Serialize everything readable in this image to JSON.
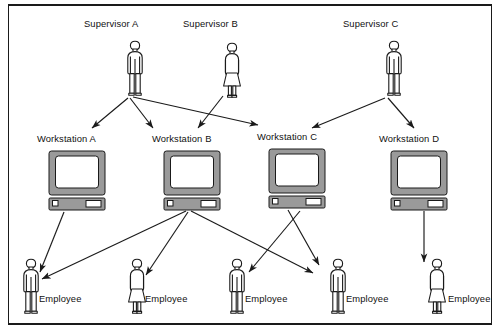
{
  "diagram": {
    "type": "hierarchy-flow",
    "title": "",
    "background_color": "#ffffff",
    "line_color": "#1a1a1a",
    "monitor_fill": "#9a9a9a",
    "screen_fill": "#ffffff",
    "person_fill": "#ffffff",
    "frame": {
      "top_rule": true,
      "bottom_rule": true,
      "left_rule": true,
      "right_rule": true
    }
  },
  "supervisors": [
    {
      "id": "sup-a",
      "label": "Supervisor A",
      "gender": "male",
      "x": 122,
      "y": 40,
      "label_x": 84,
      "label_y": 18
    },
    {
      "id": "sup-b",
      "label": "Supervisor B",
      "gender": "female",
      "x": 219,
      "y": 42,
      "label_x": 183,
      "label_y": 18
    },
    {
      "id": "sup-c",
      "label": "Supervisor C",
      "gender": "male",
      "x": 381,
      "y": 40,
      "label_x": 343,
      "label_y": 18
    }
  ],
  "workstations": [
    {
      "id": "ws-a",
      "label": "Workstation A",
      "x": 48,
      "y": 150,
      "label_x": 37,
      "label_y": 133
    },
    {
      "id": "ws-b",
      "label": "Workstation B",
      "x": 163,
      "y": 150,
      "label_x": 152,
      "label_y": 133
    },
    {
      "id": "ws-c",
      "label": "Workstation C",
      "x": 268,
      "y": 148,
      "label_x": 257,
      "label_y": 131
    },
    {
      "id": "ws-d",
      "label": "Workstation D",
      "x": 390,
      "y": 150,
      "label_x": 379,
      "label_y": 133
    }
  ],
  "employees": [
    {
      "id": "emp-1",
      "label": "Employee",
      "gender": "male",
      "x": 18,
      "y": 258,
      "label_x": 39,
      "label_y": 293
    },
    {
      "id": "emp-2",
      "label": "Employee",
      "gender": "female",
      "x": 124,
      "y": 258,
      "label_x": 145,
      "label_y": 293
    },
    {
      "id": "emp-3",
      "label": "Employee",
      "gender": "male",
      "x": 224,
      "y": 258,
      "label_x": 245,
      "label_y": 293
    },
    {
      "id": "emp-4",
      "label": "Employee",
      "gender": "male",
      "x": 325,
      "y": 258,
      "label_x": 346,
      "label_y": 293
    },
    {
      "id": "emp-5",
      "label": "Employee",
      "gender": "female",
      "x": 424,
      "y": 258,
      "label_x": 448,
      "label_y": 293
    }
  ],
  "connections": [
    {
      "from": "sup-a",
      "to": "ws-a",
      "x1": 128,
      "y1": 98,
      "x2": 92,
      "y2": 128
    },
    {
      "from": "sup-a",
      "to": "ws-b",
      "x1": 130,
      "y1": 98,
      "x2": 153,
      "y2": 128
    },
    {
      "from": "sup-a",
      "to": "ws-c",
      "x1": 133,
      "y1": 97,
      "x2": 258,
      "y2": 125
    },
    {
      "from": "sup-b",
      "to": "ws-b",
      "x1": 223,
      "y1": 96,
      "x2": 198,
      "y2": 128
    },
    {
      "from": "sup-c",
      "to": "ws-c",
      "x1": 385,
      "y1": 98,
      "x2": 312,
      "y2": 128
    },
    {
      "from": "sup-c",
      "to": "ws-d",
      "x1": 388,
      "y1": 98,
      "x2": 414,
      "y2": 128
    },
    {
      "from": "ws-a",
      "to": "emp-1",
      "x1": 64,
      "y1": 212,
      "x2": 40,
      "y2": 272
    },
    {
      "from": "ws-b",
      "to": "emp-1",
      "x1": 186,
      "y1": 211,
      "x2": 42,
      "y2": 279
    },
    {
      "from": "ws-b",
      "to": "emp-2",
      "x1": 188,
      "y1": 212,
      "x2": 146,
      "y2": 275
    },
    {
      "from": "ws-b",
      "to": "emp-4",
      "x1": 191,
      "y1": 211,
      "x2": 313,
      "y2": 273
    },
    {
      "from": "ws-c",
      "to": "emp-3",
      "x1": 300,
      "y1": 211,
      "x2": 249,
      "y2": 272
    },
    {
      "from": "ws-c",
      "to": "emp-4",
      "x1": 288,
      "y1": 210,
      "x2": 319,
      "y2": 265
    },
    {
      "from": "ws-d",
      "to": "emp-5",
      "x1": 424,
      "y1": 211,
      "x2": 424,
      "y2": 262
    }
  ]
}
